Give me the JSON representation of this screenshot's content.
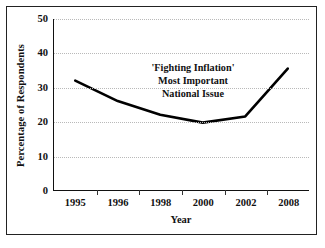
{
  "chart_data": {
    "type": "line",
    "title": "",
    "xlabel": "Year",
    "ylabel": "Percentage of Respondents",
    "categories": [
      "1995",
      "1996",
      "1998",
      "2000",
      "2002",
      "2008"
    ],
    "values": [
      32,
      26,
      22,
      19.7,
      21.5,
      35.5
    ],
    "series": [
      {
        "name": "'Fighting Inflation' Most Important National Issue",
        "values": [
          32,
          26,
          22,
          19.7,
          21.5,
          35.5
        ]
      }
    ],
    "ylim": [
      0,
      50
    ],
    "yticks": [
      0,
      10,
      20,
      30,
      40,
      50
    ],
    "ytick_labels": [
      "0",
      "10",
      "20",
      "30",
      "40",
      "50"
    ],
    "xtick_labels": [
      "1995",
      "1996",
      "1998",
      "2000",
      "2002",
      "2008"
    ],
    "grid": "horizontal-dotted",
    "legend": "none",
    "annotations": [
      {
        "line1": "'Fighting Inflation'",
        "line2": "Most Important",
        "line3": "National Issue"
      }
    ],
    "line_color": "#000000",
    "grid_color": "#b9b9b9",
    "axis_color": "#111111"
  },
  "annotation": {
    "line1": "'Fighting Inflation'",
    "line2": "Most Important",
    "line3": "National Issue"
  },
  "axes": {
    "y_title": "Percentage of Respondents",
    "x_title": "Year"
  }
}
